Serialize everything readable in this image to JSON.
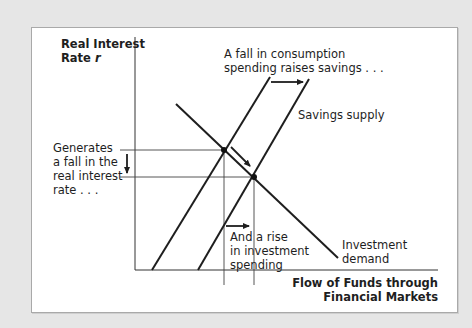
{
  "diagram": {
    "type": "supply-demand (loanable funds market)",
    "y_axis_label": [
      "Real Interest",
      "Rate r"
    ],
    "x_axis_label": [
      "Flow of Funds through",
      "Financial Markets"
    ],
    "curves": [
      {
        "name": "Savings supply (initial)",
        "kind": "upward-sloping line"
      },
      {
        "name": "Savings supply",
        "kind": "upward-sloping line, shifted right"
      },
      {
        "name": "Investment demand",
        "kind": "downward-sloping line"
      }
    ],
    "annotations": {
      "top": [
        "A fall in consumption",
        "spending raises savings . . ."
      ],
      "supply_label": "Savings supply",
      "left": [
        "Generates",
        "a fall in the",
        "real interest",
        "rate . . ."
      ],
      "bottom": [
        "And a rise",
        "in investment",
        "spending"
      ],
      "demand_label": [
        "Investment",
        "demand"
      ]
    },
    "equilibria": [
      {
        "name": "initial equilibrium"
      },
      {
        "name": "new equilibrium (lower r, higher flow of funds)"
      }
    ],
    "colors": {
      "background": "#e6e6e6",
      "panel": "#ffffff",
      "ink": "#1e1e1e"
    }
  }
}
